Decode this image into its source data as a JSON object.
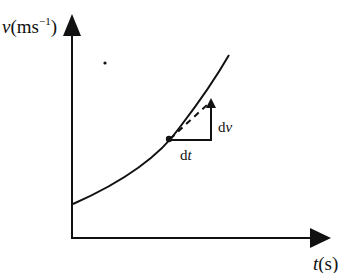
{
  "diagram": {
    "type": "velocity-time graph",
    "y_axis": {
      "label_var": "v",
      "label_unit_base": "(ms",
      "label_unit_sup": "−1",
      "label_unit_close": ")"
    },
    "x_axis": {
      "label_var": "t",
      "label_unit": "(s)"
    },
    "curve": "increasing convex curve (accelerating)",
    "tangent": {
      "style": "dashed"
    },
    "triangle": {
      "horizontal_label_d": "d",
      "horizontal_label_var": "t",
      "vertical_label_d": "d",
      "vertical_label_var": "v"
    },
    "colors": {
      "ink": "#111111",
      "background": "#ffffff"
    }
  }
}
